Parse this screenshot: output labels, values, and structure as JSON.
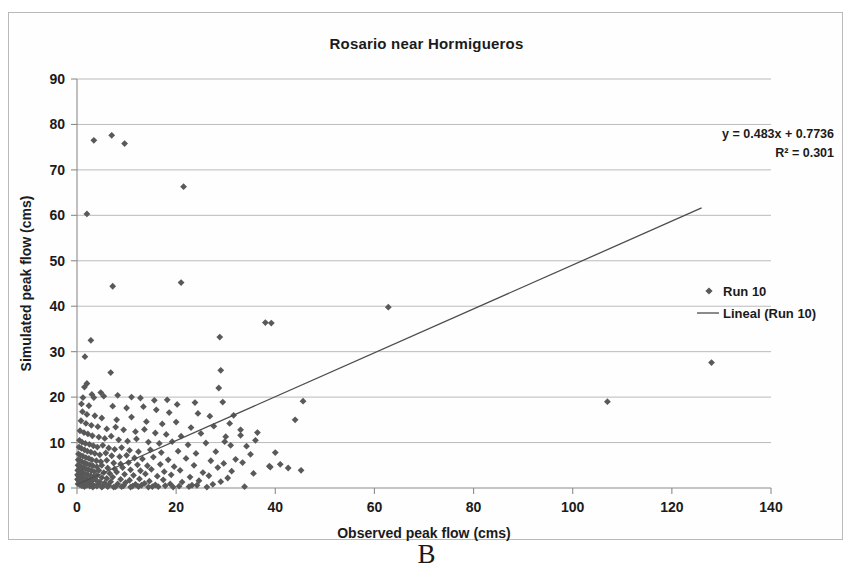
{
  "figure": {
    "caption": "B",
    "background_color": "#ffffff",
    "frame_border_color": "#b9b9b9"
  },
  "chart_data": {
    "type": "scatter",
    "title": "Rosario near Hormigueros",
    "xlabel": "Observed peak flow (cms)",
    "ylabel": "Simulated peak flow (cms)",
    "xlim": [
      0,
      140
    ],
    "ylim": [
      0,
      90
    ],
    "xticks": [
      0,
      20,
      40,
      60,
      80,
      100,
      120,
      140
    ],
    "yticks": [
      0,
      10,
      20,
      30,
      40,
      50,
      60,
      70,
      80,
      90
    ],
    "grid": "horizontal",
    "legend_position": "right",
    "marker_color": "#595959",
    "line_color": "#4d4d4d",
    "annotations": [
      "y = 0.483x + 0.7736",
      "R² = 0.301"
    ],
    "trendline": {
      "label": "Lineal (Run 10)",
      "slope": 0.483,
      "intercept": 0.7736,
      "r_squared": 0.301,
      "x_start": 0,
      "x_end": 126
    },
    "series": [
      {
        "name": "Run 10",
        "marker": "diamond",
        "points": [
          [
            3.4,
            76.5
          ],
          [
            7.0,
            77.6
          ],
          [
            9.6,
            75.8
          ],
          [
            2.0,
            60.3
          ],
          [
            21.5,
            66.3
          ],
          [
            7.2,
            44.4
          ],
          [
            21.0,
            45.2
          ],
          [
            62.8,
            39.8
          ],
          [
            38.0,
            36.4
          ],
          [
            39.2,
            36.3
          ],
          [
            28.8,
            33.2
          ],
          [
            2.8,
            32.5
          ],
          [
            128.0,
            27.6
          ],
          [
            1.6,
            28.9
          ],
          [
            6.8,
            25.4
          ],
          [
            29.0,
            25.9
          ],
          [
            2.0,
            23.0
          ],
          [
            1.5,
            22.2
          ],
          [
            28.6,
            22.0
          ],
          [
            1.2,
            19.9
          ],
          [
            3.4,
            19.9
          ],
          [
            12.8,
            19.8
          ],
          [
            15.6,
            19.3
          ],
          [
            45.6,
            19.1
          ],
          [
            107.0,
            19.0
          ],
          [
            0.9,
            18.5
          ],
          [
            2.4,
            18.1
          ],
          [
            7.2,
            18.0
          ],
          [
            10.0,
            17.6
          ],
          [
            13.4,
            17.9
          ],
          [
            16.0,
            17.2
          ],
          [
            18.6,
            16.6
          ],
          [
            29.4,
            18.9
          ],
          [
            31.6,
            16.0
          ],
          [
            1.1,
            16.8
          ],
          [
            2.0,
            16.2
          ],
          [
            3.6,
            15.9
          ],
          [
            5.0,
            15.4
          ],
          [
            8.0,
            15.0
          ],
          [
            11.0,
            15.6
          ],
          [
            14.0,
            14.6
          ],
          [
            17.2,
            14.1
          ],
          [
            20.0,
            14.5
          ],
          [
            23.0,
            13.3
          ],
          [
            44.0,
            15.0
          ],
          [
            0.8,
            14.8
          ],
          [
            1.8,
            14.2
          ],
          [
            2.9,
            13.8
          ],
          [
            4.2,
            13.5
          ],
          [
            6.0,
            13.0
          ],
          [
            7.8,
            13.4
          ],
          [
            9.4,
            12.8
          ],
          [
            11.8,
            12.4
          ],
          [
            13.6,
            12.9
          ],
          [
            15.8,
            12.1
          ],
          [
            18.0,
            11.8
          ],
          [
            21.0,
            11.4
          ],
          [
            25.0,
            12.0
          ],
          [
            30.0,
            11.3
          ],
          [
            33.0,
            11.6
          ],
          [
            0.6,
            12.6
          ],
          [
            1.4,
            12.2
          ],
          [
            2.2,
            11.9
          ],
          [
            3.1,
            11.5
          ],
          [
            4.4,
            11.2
          ],
          [
            5.6,
            10.9
          ],
          [
            6.9,
            11.4
          ],
          [
            8.4,
            10.6
          ],
          [
            10.2,
            10.3
          ],
          [
            12.0,
            10.8
          ],
          [
            14.4,
            10.1
          ],
          [
            16.6,
            9.8
          ],
          [
            19.2,
            10.2
          ],
          [
            22.4,
            9.5
          ],
          [
            26.0,
            9.9
          ],
          [
            31.0,
            9.4
          ],
          [
            0.5,
            10.5
          ],
          [
            1.0,
            10.1
          ],
          [
            1.7,
            9.8
          ],
          [
            2.5,
            9.6
          ],
          [
            3.3,
            9.3
          ],
          [
            4.1,
            9.0
          ],
          [
            5.2,
            9.4
          ],
          [
            6.4,
            8.8
          ],
          [
            7.6,
            8.5
          ],
          [
            9.0,
            8.9
          ],
          [
            10.6,
            8.3
          ],
          [
            12.4,
            8.0
          ],
          [
            14.8,
            8.4
          ],
          [
            17.0,
            7.8
          ],
          [
            20.4,
            8.1
          ],
          [
            24.0,
            7.6
          ],
          [
            28.0,
            8.0
          ],
          [
            35.0,
            7.4
          ],
          [
            40.0,
            7.8
          ],
          [
            0.4,
            9.0
          ],
          [
            0.9,
            8.7
          ],
          [
            1.5,
            8.4
          ],
          [
            2.1,
            8.1
          ],
          [
            2.8,
            7.9
          ],
          [
            3.6,
            7.6
          ],
          [
            4.6,
            7.3
          ],
          [
            5.8,
            7.7
          ],
          [
            7.0,
            7.1
          ],
          [
            8.6,
            6.9
          ],
          [
            10.0,
            7.2
          ],
          [
            11.6,
            6.6
          ],
          [
            13.2,
            6.4
          ],
          [
            15.4,
            6.8
          ],
          [
            18.4,
            6.2
          ],
          [
            22.0,
            6.5
          ],
          [
            27.0,
            6.0
          ],
          [
            32.0,
            6.3
          ],
          [
            29.6,
            5.4
          ],
          [
            33.4,
            5.6
          ],
          [
            0.3,
            7.5
          ],
          [
            0.7,
            7.2
          ],
          [
            1.2,
            7.0
          ],
          [
            1.8,
            6.7
          ],
          [
            2.4,
            6.5
          ],
          [
            3.0,
            6.2
          ],
          [
            3.9,
            6.0
          ],
          [
            4.8,
            5.8
          ],
          [
            6.0,
            6.1
          ],
          [
            7.4,
            5.5
          ],
          [
            8.8,
            5.3
          ],
          [
            10.4,
            5.6
          ],
          [
            12.2,
            5.1
          ],
          [
            14.2,
            4.9
          ],
          [
            16.8,
            5.2
          ],
          [
            19.6,
            4.7
          ],
          [
            23.6,
            5.0
          ],
          [
            28.4,
            4.5
          ],
          [
            38.8,
            4.8
          ],
          [
            45.2,
            3.9
          ],
          [
            0.25,
            6.2
          ],
          [
            0.6,
            6.0
          ],
          [
            1.0,
            5.8
          ],
          [
            1.5,
            5.5
          ],
          [
            2.0,
            5.3
          ],
          [
            2.6,
            5.1
          ],
          [
            3.2,
            4.9
          ],
          [
            4.0,
            4.7
          ],
          [
            5.0,
            5.0
          ],
          [
            6.2,
            4.4
          ],
          [
            7.6,
            4.2
          ],
          [
            9.2,
            4.5
          ],
          [
            10.8,
            4.0
          ],
          [
            12.8,
            3.8
          ],
          [
            15.0,
            4.1
          ],
          [
            17.6,
            3.6
          ],
          [
            20.8,
            3.9
          ],
          [
            25.4,
            3.4
          ],
          [
            31.2,
            3.7
          ],
          [
            35.6,
            3.2
          ],
          [
            0.2,
            5.0
          ],
          [
            0.5,
            4.8
          ],
          [
            0.9,
            4.6
          ],
          [
            1.3,
            4.4
          ],
          [
            1.8,
            4.2
          ],
          [
            2.3,
            4.0
          ],
          [
            2.9,
            3.8
          ],
          [
            3.5,
            3.6
          ],
          [
            4.4,
            3.9
          ],
          [
            5.4,
            3.4
          ],
          [
            6.6,
            3.2
          ],
          [
            8.0,
            3.5
          ],
          [
            9.6,
            3.0
          ],
          [
            11.4,
            2.8
          ],
          [
            13.8,
            3.1
          ],
          [
            16.2,
            2.6
          ],
          [
            19.0,
            2.9
          ],
          [
            22.8,
            2.4
          ],
          [
            26.6,
            2.7
          ],
          [
            30.4,
            2.2
          ],
          [
            0.15,
            3.9
          ],
          [
            0.4,
            3.7
          ],
          [
            0.8,
            3.5
          ],
          [
            1.1,
            3.3
          ],
          [
            1.6,
            3.1
          ],
          [
            2.1,
            2.9
          ],
          [
            2.7,
            2.7
          ],
          [
            3.3,
            2.5
          ],
          [
            4.1,
            2.8
          ],
          [
            5.0,
            2.3
          ],
          [
            6.0,
            2.1
          ],
          [
            7.2,
            2.4
          ],
          [
            8.8,
            1.9
          ],
          [
            10.6,
            1.7
          ],
          [
            12.6,
            2.0
          ],
          [
            14.6,
            1.5
          ],
          [
            17.4,
            1.8
          ],
          [
            21.2,
            1.3
          ],
          [
            24.6,
            1.6
          ],
          [
            29.0,
            1.4
          ],
          [
            0.1,
            2.9
          ],
          [
            0.3,
            2.7
          ],
          [
            0.6,
            2.5
          ],
          [
            1.0,
            2.3
          ],
          [
            1.4,
            2.1
          ],
          [
            1.9,
            1.9
          ],
          [
            2.4,
            1.7
          ],
          [
            3.0,
            1.5
          ],
          [
            3.8,
            1.8
          ],
          [
            4.6,
            1.3
          ],
          [
            5.6,
            1.1
          ],
          [
            6.8,
            1.4
          ],
          [
            8.2,
            0.9
          ],
          [
            9.8,
            1.2
          ],
          [
            11.8,
            0.8
          ],
          [
            13.6,
            1.0
          ],
          [
            15.8,
            0.7
          ],
          [
            18.8,
            0.9
          ],
          [
            23.2,
            0.6
          ],
          [
            27.4,
            0.8
          ],
          [
            0.1,
            1.9
          ],
          [
            0.3,
            1.7
          ],
          [
            0.5,
            1.5
          ],
          [
            0.8,
            1.3
          ],
          [
            1.2,
            1.1
          ],
          [
            1.6,
            0.9
          ],
          [
            2.2,
            1.2
          ],
          [
            2.8,
            0.7
          ],
          [
            3.4,
            0.5
          ],
          [
            4.2,
            0.8
          ],
          [
            5.2,
            0.4
          ],
          [
            6.4,
            0.6
          ],
          [
            7.8,
            0.3
          ],
          [
            9.4,
            0.5
          ],
          [
            11.2,
            0.4
          ],
          [
            13.0,
            0.6
          ],
          [
            15.2,
            0.3
          ],
          [
            17.8,
            0.5
          ],
          [
            20.6,
            0.4
          ],
          [
            24.2,
            0.6
          ],
          [
            0.2,
            0.9
          ],
          [
            0.6,
            0.7
          ],
          [
            1.0,
            0.5
          ],
          [
            1.5,
            0.3
          ],
          [
            2.0,
            0.6
          ],
          [
            2.6,
            0.4
          ],
          [
            3.2,
            0.2
          ],
          [
            4.0,
            0.4
          ],
          [
            5.0,
            0.2
          ],
          [
            6.2,
            0.3
          ],
          [
            7.4,
            0.2
          ],
          [
            9.0,
            0.3
          ],
          [
            10.8,
            0.2
          ],
          [
            12.4,
            0.3
          ],
          [
            14.4,
            0.2
          ],
          [
            16.4,
            0.3
          ],
          [
            19.4,
            0.2
          ],
          [
            22.6,
            0.3
          ],
          [
            26.2,
            0.2
          ],
          [
            33.8,
            0.3
          ],
          [
            4.8,
            21.0
          ],
          [
            3.0,
            20.6
          ],
          [
            5.4,
            20.2
          ],
          [
            8.2,
            20.4
          ],
          [
            11.0,
            20.0
          ],
          [
            36.0,
            10.5
          ],
          [
            41.0,
            5.2
          ],
          [
            39.0,
            4.6
          ],
          [
            42.6,
            4.4
          ],
          [
            34.2,
            9.2
          ],
          [
            26.8,
            15.8
          ],
          [
            24.4,
            16.4
          ],
          [
            20.2,
            18.4
          ],
          [
            23.8,
            18.8
          ],
          [
            18.2,
            19.4
          ],
          [
            30.8,
            14.2
          ],
          [
            27.6,
            13.6
          ],
          [
            33.0,
            12.8
          ],
          [
            36.4,
            12.2
          ],
          [
            29.8,
            10.2
          ]
        ]
      }
    ]
  }
}
